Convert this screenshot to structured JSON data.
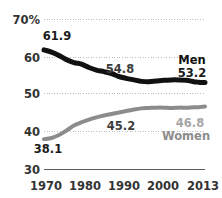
{
  "chart_data": {
    "type": "line",
    "title": "",
    "subtitle": "",
    "xlabel": "",
    "ylabel": "",
    "xlim": [
      1970,
      2013
    ],
    "ylim": [
      30,
      70
    ],
    "grid": true,
    "legend_position": "inline-right",
    "x_ticks": [
      "1970",
      "1980",
      "1990",
      "2000",
      "2013"
    ],
    "x_tick_values": [
      1970,
      1980,
      1990,
      2000,
      2013
    ],
    "y_ticks": [
      "30",
      "40",
      "50",
      "60",
      "70%"
    ],
    "y_tick_values": [
      30,
      40,
      50,
      60,
      70
    ],
    "series": [
      {
        "name": "Men",
        "color": "#111111",
        "x": [
          1970,
          1972,
          1974,
          1976,
          1978,
          1980,
          1982,
          1984,
          1986,
          1988,
          1990,
          1992,
          1994,
          1996,
          1998,
          2000,
          2002,
          2004,
          2006,
          2008,
          2010,
          2011,
          2012,
          2013
        ],
        "values": [
          61.9,
          61.3,
          60.4,
          59.3,
          58.5,
          58.1,
          57.2,
          56.5,
          56.1,
          55.6,
          54.8,
          54.3,
          53.9,
          53.5,
          53.4,
          53.6,
          53.8,
          53.9,
          53.9,
          53.8,
          53.4,
          53.3,
          53.2,
          53.2
        ]
      },
      {
        "name": "Women",
        "color": "#8c8c8c",
        "x": [
          1970,
          1972,
          1974,
          1976,
          1978,
          1980,
          1982,
          1984,
          1986,
          1988,
          1990,
          1992,
          1994,
          1996,
          1998,
          2000,
          2002,
          2004,
          2006,
          2008,
          2010,
          2011,
          2012,
          2013
        ],
        "values": [
          38.1,
          38.4,
          39.2,
          40.4,
          41.7,
          42.6,
          43.3,
          43.9,
          44.4,
          44.8,
          45.2,
          45.6,
          46.0,
          46.3,
          46.4,
          46.5,
          46.5,
          46.4,
          46.5,
          46.5,
          46.6,
          46.6,
          46.7,
          46.8
        ]
      }
    ],
    "data_labels": [
      {
        "id": "men-start",
        "text": "61.9",
        "series": "Men",
        "x": 1970,
        "value": 61.9,
        "style": "dark"
      },
      {
        "id": "men-mid",
        "text": "54.8",
        "series": "Men",
        "x": 1990,
        "value": 54.8,
        "style": "mid"
      },
      {
        "id": "men-end",
        "text": "53.2",
        "series": "Men",
        "x": 2013,
        "value": 53.2,
        "style": "dark"
      },
      {
        "id": "women-start",
        "text": "38.1",
        "series": "Women",
        "x": 1970,
        "value": 38.1,
        "style": "dark"
      },
      {
        "id": "women-mid",
        "text": "45.2",
        "series": "Women",
        "x": 1990,
        "value": 45.2,
        "style": "mid"
      },
      {
        "id": "women-end",
        "text": "46.8",
        "series": "Women",
        "x": 2013,
        "value": 46.8,
        "style": "light"
      }
    ],
    "series_labels": [
      {
        "id": "men",
        "text": "Men"
      },
      {
        "id": "women",
        "text": "Women"
      }
    ],
    "colors": {
      "men_line": "#111111",
      "women_line": "#8c8c8c",
      "gridline": "#b9b9b9",
      "baseline": "#5b5b5b",
      "tick_text": "#333333",
      "background": "#ffffff"
    }
  }
}
